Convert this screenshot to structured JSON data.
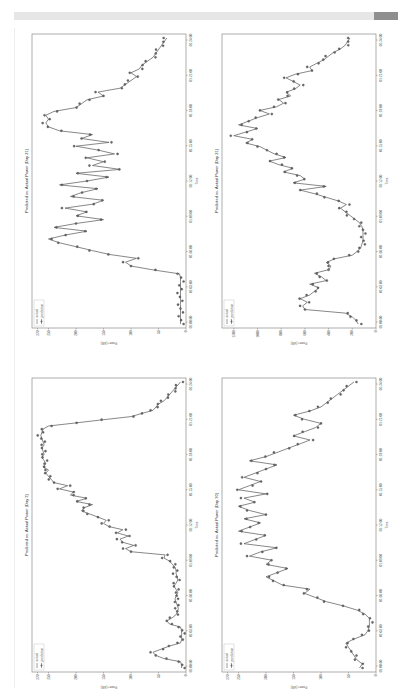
{
  "page": {
    "header_bar": "",
    "layout": "rotated-landscape-page"
  },
  "chart_data": [
    {
      "id": "day3",
      "type": "line",
      "title": "Predicted vs. Actual Power (Day 3)",
      "xlabel": "Time",
      "ylabel": "Power (kW)",
      "legend": [
        "actual",
        "prediction"
      ],
      "legend_position": "upper left",
      "x_ticks": [
        "01:00:00",
        "01:03:00",
        "01:06:00",
        "01:09:00",
        "01:12:00",
        "01:15:00",
        "01:18:00",
        "01:21:00",
        "01:24:00"
      ],
      "y_ticks": [
        0,
        50,
        100,
        150,
        200,
        250,
        270
      ],
      "ylim": [
        0,
        280
      ],
      "values": [
        8,
        8,
        10,
        40,
        55,
        60,
        45,
        30,
        10,
        8,
        8,
        8,
        8,
        10,
        30,
        35,
        25,
        18,
        15,
        14,
        16,
        18,
        20,
        18,
        15,
        18,
        22,
        18,
        15,
        16,
        18,
        18,
        20,
        25,
        30,
        40,
        38,
        100,
        110,
        95,
        115,
        120,
        105,
        125,
        115,
        140,
        150,
        145,
        160,
        175,
        190,
        185,
        170,
        200,
        180,
        210,
        205,
        230,
        215,
        240,
        245,
        250,
        255,
        250,
        260,
        255,
        258,
        262,
        258,
        260,
        262,
        258,
        260,
        262,
        264,
        262,
        260,
        250,
        200,
        150,
        100,
        80,
        60,
        55,
        50,
        40,
        35,
        30,
        25,
        20,
        15,
        10
      ]
    },
    {
      "id": "day21",
      "type": "line",
      "title": "Predicted vs. Actual Power (Day 21)",
      "xlabel": "Time",
      "ylabel": "Power (kW)",
      "legend": [
        "actual",
        "prediction"
      ],
      "legend_position": "upper left",
      "x_ticks": [
        "01:00:00",
        "01:03:00",
        "01:06:00",
        "01:09:00",
        "01:12:00",
        "01:15:00",
        "01:18:00",
        "01:21:00",
        "01:24:00"
      ],
      "y_ticks": [
        0,
        200,
        400,
        600,
        800,
        1000,
        1200
      ],
      "ylim": [
        0,
        1300
      ],
      "values": [
        150,
        170,
        200,
        260,
        600,
        620,
        580,
        640,
        560,
        520,
        480,
        560,
        420,
        460,
        520,
        400,
        380,
        420,
        350,
        200,
        160,
        130,
        120,
        110,
        110,
        110,
        110,
        120,
        140,
        180,
        220,
        260,
        300,
        250,
        320,
        420,
        520,
        640,
        420,
        700,
        600,
        640,
        780,
        700,
        820,
        900,
        760,
        860,
        920,
        980,
        1100,
        1040,
        1200,
        1100,
        1000,
        1160,
        1080,
        1000,
        900,
        980,
        840,
        780,
        820,
        720,
        760,
        680,
        640,
        700,
        760,
        680,
        540,
        560,
        500,
        440,
        400,
        360,
        300,
        260,
        240,
        220
      ]
    },
    {
      "id": "day21b",
      "type": "line",
      "title": "Predicted vs. Actual Power (Day 21)",
      "xlabel": "Time",
      "ylabel": "Power (kW)",
      "legend": [
        "actual",
        "prediction"
      ],
      "legend_position": "upper left",
      "x_ticks": [
        "01:00:00",
        "01:03:00",
        "01:06:00",
        "01:09:00",
        "01:12:00",
        "01:15:00",
        "01:18:00",
        "01:21:00",
        "01:24:00"
      ],
      "y_ticks": [
        0,
        50,
        100,
        150,
        200,
        250,
        270
      ],
      "ylim": [
        0,
        280
      ],
      "values": [
        10,
        10,
        10,
        10,
        10,
        10,
        10,
        10,
        10,
        10,
        10,
        10,
        10,
        12,
        60,
        100,
        110,
        90,
        140,
        170,
        200,
        230,
        250,
        220,
        180,
        240,
        200,
        150,
        200,
        180,
        220,
        170,
        150,
        210,
        190,
        160,
        230,
        180,
        140,
        200,
        120,
        170,
        150,
        180,
        130,
        160,
        200,
        140,
        190,
        170,
        230,
        250,
        255,
        250,
        255,
        240,
        200,
        190,
        180,
        150,
        160,
        120,
        110,
        100,
        90,
        100,
        85,
        80,
        70,
        60,
        55,
        50,
        45,
        40,
        35
      ]
    },
    {
      "id": "day30",
      "type": "line",
      "title": "Predicted vs. Actual Power (Day 30)",
      "xlabel": "Time",
      "ylabel": "Power (kW)",
      "legend": [
        "actual",
        "prediction"
      ],
      "legend_position": "upper left",
      "x_ticks": [
        "01:00:00",
        "01:03:00",
        "01:06:00",
        "01:09:00",
        "01:12:00",
        "01:15:00",
        "01:18:00",
        "01:21:00",
        "01:24:00"
      ],
      "y_ticks": [
        0,
        50,
        100,
        150,
        200,
        250,
        270
      ],
      "ylim": [
        0,
        280
      ],
      "values": [
        30,
        25,
        35,
        40,
        45,
        50,
        55,
        40,
        20,
        15,
        12,
        12,
        12,
        20,
        35,
        60,
        90,
        110,
        130,
        120,
        170,
        185,
        200,
        180,
        160,
        200,
        190,
        230,
        210,
        180,
        240,
        220,
        200,
        250,
        230,
        210,
        240,
        200,
        230,
        250,
        220,
        240,
        200,
        250,
        230,
        210,
        240,
        220,
        200,
        180,
        230,
        200,
        180,
        160,
        140,
        120,
        150,
        130,
        110,
        100,
        130,
        150,
        120,
        100,
        90,
        80,
        70,
        60,
        50,
        40
      ]
    }
  ]
}
